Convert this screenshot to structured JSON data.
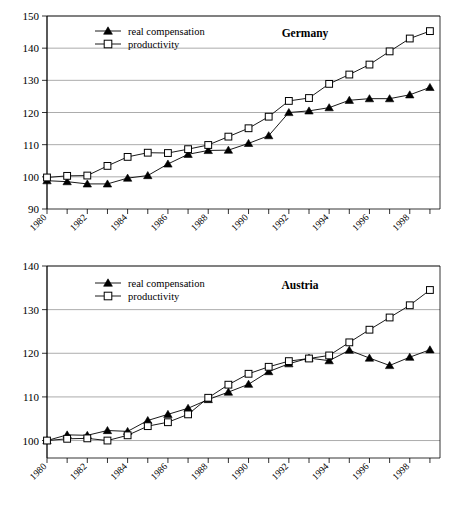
{
  "figure": {
    "panel_count": 2,
    "legend_labels": [
      "real compensation",
      "productivity"
    ]
  },
  "chart_data": [
    {
      "type": "line",
      "title": "Germany",
      "xlabel": "",
      "ylabel": "",
      "xlim": [
        1980,
        1999.5
      ],
      "ylim": [
        90,
        150
      ],
      "yticks": [
        90,
        100,
        110,
        120,
        130,
        140,
        150
      ],
      "xticks": [
        1980,
        1982,
        1984,
        1986,
        1988,
        1990,
        1992,
        1994,
        1996,
        1998
      ],
      "xtick_labels": [
        "1980",
        "1982",
        "1984",
        "1986",
        "1988",
        "1990",
        "1992",
        "1994",
        "1996",
        "1998"
      ],
      "grid": true,
      "legend_position": "top-left",
      "x": [
        1980,
        1981,
        1982,
        1983,
        1984,
        1985,
        1986,
        1987,
        1988,
        1989,
        1990,
        1991,
        1992,
        1993,
        1994,
        1995,
        1996,
        1997,
        1998,
        1999
      ],
      "series": [
        {
          "name": "real compensation",
          "marker": "filled-triangle",
          "values": [
            98.8,
            98.5,
            97.8,
            97.8,
            99.6,
            100.4,
            104.0,
            107.0,
            108.2,
            108.3,
            110.4,
            112.8,
            120.0,
            120.5,
            121.5,
            123.8,
            124.3,
            124.3,
            125.5,
            127.8
          ]
        },
        {
          "name": "productivity",
          "marker": "open-square",
          "values": [
            99.8,
            100.3,
            100.4,
            103.4,
            106.2,
            107.5,
            107.4,
            108.6,
            109.9,
            112.5,
            115.1,
            118.7,
            123.6,
            124.5,
            128.9,
            131.8,
            134.9,
            139.0,
            143.0,
            145.3
          ]
        }
      ]
    },
    {
      "type": "line",
      "title": "Austria",
      "xlabel": "",
      "ylabel": "",
      "xlim": [
        1980,
        1999.5
      ],
      "ylim": [
        96,
        140
      ],
      "yticks": [
        100,
        110,
        120,
        130,
        140
      ],
      "xticks": [
        1980,
        1982,
        1984,
        1986,
        1988,
        1990,
        1992,
        1994,
        1996,
        1998
      ],
      "xtick_labels": [
        "1980",
        "1982",
        "1984",
        "1986",
        "1988",
        "1990",
        "1992",
        "1994",
        "1996",
        "1998"
      ],
      "grid": true,
      "legend_position": "top-left",
      "x": [
        1980,
        1981,
        1982,
        1983,
        1984,
        1985,
        1986,
        1987,
        1988,
        1989,
        1990,
        1991,
        1992,
        1993,
        1994,
        1995,
        1996,
        1997,
        1998,
        1999
      ],
      "series": [
        {
          "name": "real compensation",
          "marker": "filled-triangle",
          "values": [
            100.0,
            101.3,
            101.2,
            102.3,
            102.1,
            104.6,
            106.0,
            107.4,
            109.4,
            111.1,
            112.9,
            115.8,
            117.6,
            118.9,
            118.3,
            120.7,
            118.9,
            117.2,
            119.1,
            120.8
          ]
        },
        {
          "name": "productivity",
          "marker": "open-square",
          "values": [
            100.0,
            100.4,
            100.5,
            100.0,
            101.2,
            103.3,
            104.2,
            106.0,
            109.8,
            112.8,
            115.3,
            116.9,
            118.2,
            118.8,
            119.5,
            122.5,
            125.4,
            128.2,
            131.0,
            134.5,
            137.0
          ]
        }
      ]
    }
  ]
}
